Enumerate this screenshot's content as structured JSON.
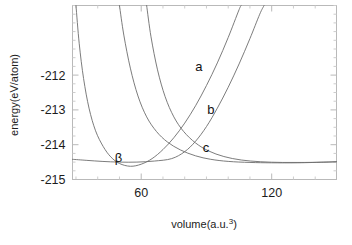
{
  "figure": {
    "background_color": "#ffffff",
    "frame_color": "#b9b9b9",
    "curve_color": "#6d6d6d",
    "text_color": "#1c1c1c"
  },
  "chart_data": {
    "type": "line",
    "title": "",
    "xlabel": "volume(a.u.",
    "xlabel_sup": "3",
    "xlabel_tail": ")",
    "ylabel": "energy(eV/atom)",
    "xlim": [
      28.4,
      149.8
    ],
    "ylim": [
      -215.0,
      -210.0
    ],
    "xticks": [
      60,
      120
    ],
    "xtick_labels": [
      "60",
      "120"
    ],
    "yticks": [
      -212,
      -213,
      -214,
      -215
    ],
    "ytick_labels": [
      "-212",
      "-213",
      "-214",
      "-215"
    ],
    "xtick_minor_step": 10,
    "ytick_minor_step": 0.25,
    "grid": false,
    "legend": "none",
    "asymptote_energy": -214.5,
    "annotations": [
      {
        "text": "a",
        "x": 86.5,
        "y": -211.88
      },
      {
        "text": "b",
        "x": 92.0,
        "y": -213.12
      },
      {
        "text": "c",
        "x": 89.8,
        "y": -214.2
      },
      {
        "text": "β",
        "x": 49.5,
        "y": -214.5
      }
    ],
    "series": [
      {
        "name": "β",
        "label": "β",
        "minimum": {
          "volume": 55.0,
          "energy": -214.62
        },
        "points": [
          {
            "x": 30.0,
            "y": -210.0
          },
          {
            "x": 31.5,
            "y": -211.1
          },
          {
            "x": 33.5,
            "y": -212.1
          },
          {
            "x": 36.0,
            "y": -212.95
          },
          {
            "x": 39.0,
            "y": -213.6
          },
          {
            "x": 42.5,
            "y": -214.05
          },
          {
            "x": 46.0,
            "y": -214.35
          },
          {
            "x": 50.0,
            "y": -214.54
          },
          {
            "x": 55.0,
            "y": -214.62
          },
          {
            "x": 60.0,
            "y": -214.56
          },
          {
            "x": 65.0,
            "y": -214.4
          },
          {
            "x": 70.0,
            "y": -214.14
          },
          {
            "x": 75.0,
            "y": -213.8
          },
          {
            "x": 80.0,
            "y": -213.38
          },
          {
            "x": 85.0,
            "y": -212.88
          },
          {
            "x": 90.0,
            "y": -212.3
          },
          {
            "x": 95.0,
            "y": -211.65
          },
          {
            "x": 100.0,
            "y": -210.92
          },
          {
            "x": 105.0,
            "y": -210.12
          },
          {
            "x": 106.0,
            "y": -210.0
          }
        ]
      },
      {
        "name": "b-curve",
        "label": "b",
        "minimum": {
          "volume": 132.0,
          "energy": -214.52
        },
        "points": [
          {
            "x": 50.0,
            "y": -210.0
          },
          {
            "x": 52.0,
            "y": -210.85
          },
          {
            "x": 55.0,
            "y": -211.8
          },
          {
            "x": 58.5,
            "y": -212.6
          },
          {
            "x": 62.5,
            "y": -213.2
          },
          {
            "x": 67.0,
            "y": -213.62
          },
          {
            "x": 72.0,
            "y": -213.92
          },
          {
            "x": 78.0,
            "y": -214.15
          },
          {
            "x": 85.0,
            "y": -214.32
          },
          {
            "x": 92.0,
            "y": -214.42
          },
          {
            "x": 100.0,
            "y": -214.48
          },
          {
            "x": 110.0,
            "y": -214.51
          },
          {
            "x": 120.0,
            "y": -214.52
          },
          {
            "x": 132.0,
            "y": -214.52
          },
          {
            "x": 145.0,
            "y": -214.5
          },
          {
            "x": 149.8,
            "y": -214.49
          }
        ]
      },
      {
        "name": "c-curve",
        "label": "c",
        "minimum": {
          "volume": 128.0,
          "energy": -214.5
        },
        "points": [
          {
            "x": 62.5,
            "y": -210.0
          },
          {
            "x": 64.5,
            "y": -210.9
          },
          {
            "x": 67.5,
            "y": -211.85
          },
          {
            "x": 71.0,
            "y": -212.62
          },
          {
            "x": 75.0,
            "y": -213.2
          },
          {
            "x": 79.5,
            "y": -213.62
          },
          {
            "x": 85.0,
            "y": -213.95
          },
          {
            "x": 91.0,
            "y": -214.18
          },
          {
            "x": 98.0,
            "y": -214.34
          },
          {
            "x": 106.0,
            "y": -214.44
          },
          {
            "x": 115.0,
            "y": -214.49
          },
          {
            "x": 125.0,
            "y": -214.51
          },
          {
            "x": 135.0,
            "y": -214.51
          },
          {
            "x": 145.0,
            "y": -214.5
          },
          {
            "x": 149.8,
            "y": -214.49
          }
        ]
      },
      {
        "name": "a-curve",
        "label": "a",
        "minimum": {
          "volume": 78.0,
          "energy": -214.4
        },
        "points": [
          {
            "x": 28.4,
            "y": -214.42
          },
          {
            "x": 35.0,
            "y": -214.45
          },
          {
            "x": 42.0,
            "y": -214.48
          },
          {
            "x": 50.0,
            "y": -214.5
          },
          {
            "x": 58.0,
            "y": -214.5
          },
          {
            "x": 66.0,
            "y": -214.47
          },
          {
            "x": 74.0,
            "y": -214.4
          },
          {
            "x": 80.0,
            "y": -214.2
          },
          {
            "x": 85.0,
            "y": -213.9
          },
          {
            "x": 90.0,
            "y": -213.48
          },
          {
            "x": 95.0,
            "y": -212.95
          },
          {
            "x": 100.0,
            "y": -212.35
          },
          {
            "x": 105.0,
            "y": -211.68
          },
          {
            "x": 110.0,
            "y": -210.95
          },
          {
            "x": 114.5,
            "y": -210.25
          },
          {
            "x": 116.5,
            "y": -210.0
          }
        ]
      }
    ]
  }
}
